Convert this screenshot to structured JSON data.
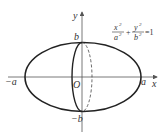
{
  "diagram": {
    "equation": {
      "x_num": "x",
      "x_den": "a",
      "y_num": "y",
      "y_den": "b",
      "exp": "2",
      "plus": "+",
      "rhs": "=1"
    },
    "axes": {
      "x_label": "x",
      "y_label": "y",
      "origin_label": "O"
    },
    "points": {
      "a_pos": "a",
      "a_neg": "−a",
      "b_pos": "b",
      "b_neg": "−b"
    },
    "colors": {
      "stroke": "#222222",
      "axis": "#555555"
    }
  }
}
